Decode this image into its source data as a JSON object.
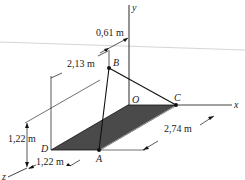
{
  "diagram": {
    "type": "3d statics diagram",
    "axes": {
      "x": "x",
      "y": "y",
      "z": "z"
    },
    "points": {
      "origin": "O",
      "B": "B",
      "C": "C",
      "A": "A",
      "D": "D"
    },
    "dimensions": {
      "offset_b_x": "0,61 m",
      "offset_b_z": "2,13 m",
      "height_b": "1,22 m",
      "width_da": "1,22 m",
      "length_ac": "2,74 m"
    },
    "colors": {
      "plate": "#4a4a4a",
      "line": "#111111",
      "scan_line": "#b0b0b0"
    }
  }
}
